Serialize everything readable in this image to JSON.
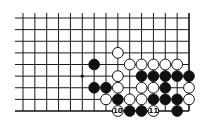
{
  "diagram": {
    "type": "go-board-fragment",
    "grid": {
      "columns": 15,
      "rows": 9,
      "origin_x": 23,
      "origin_y": 18,
      "spacing_x": 11.857,
      "spacing_y": 11.625,
      "right_edge": true,
      "bottom_edge": true
    },
    "hoshi": [
      {
        "col": 5,
        "row": 5
      }
    ],
    "stones": [
      {
        "col": 8,
        "row": 3,
        "color": "white"
      },
      {
        "col": 6,
        "row": 4,
        "color": "black"
      },
      {
        "col": 9,
        "row": 4,
        "color": "white"
      },
      {
        "col": 10,
        "row": 4,
        "color": "white"
      },
      {
        "col": 11,
        "row": 4,
        "color": "white"
      },
      {
        "col": 12,
        "row": 4,
        "color": "white"
      },
      {
        "col": 13,
        "row": 4,
        "color": "white"
      },
      {
        "col": 8,
        "row": 5,
        "color": "white"
      },
      {
        "col": 10,
        "row": 5,
        "color": "black"
      },
      {
        "col": 11,
        "row": 5,
        "color": "black"
      },
      {
        "col": 12,
        "row": 5,
        "color": "black"
      },
      {
        "col": 13,
        "row": 5,
        "color": "black"
      },
      {
        "col": 14,
        "row": 5,
        "color": "black"
      },
      {
        "col": 6,
        "row": 6,
        "color": "black"
      },
      {
        "col": 7,
        "row": 6,
        "color": "black"
      },
      {
        "col": 8,
        "row": 6,
        "color": "white"
      },
      {
        "col": 10,
        "row": 6,
        "color": "white"
      },
      {
        "col": 11,
        "row": 6,
        "color": "white"
      },
      {
        "col": 12,
        "row": 6,
        "color": "black"
      },
      {
        "col": 14,
        "row": 6,
        "color": "white"
      },
      {
        "col": 7,
        "row": 7,
        "color": "white"
      },
      {
        "col": 8,
        "row": 7,
        "color": "black"
      },
      {
        "col": 9,
        "row": 7,
        "color": "white"
      },
      {
        "col": 10,
        "row": 7,
        "color": "white"
      },
      {
        "col": 11,
        "row": 7,
        "color": "black"
      },
      {
        "col": 12,
        "row": 7,
        "color": "black"
      },
      {
        "col": 13,
        "row": 7,
        "color": "black"
      },
      {
        "col": 14,
        "row": 7,
        "color": "white"
      },
      {
        "col": 8,
        "row": 8,
        "color": "white",
        "label": "10"
      },
      {
        "col": 9,
        "row": 8,
        "color": "black"
      },
      {
        "col": 10,
        "row": 8,
        "color": "black"
      },
      {
        "col": 11,
        "row": 8,
        "color": "white",
        "label": "11"
      },
      {
        "col": 13,
        "row": 8,
        "color": "black"
      }
    ],
    "colors": {
      "line": "#1a1a1a",
      "black_stone": "#111111",
      "white_stone": "#ffffff",
      "background": "#ffffff"
    }
  }
}
